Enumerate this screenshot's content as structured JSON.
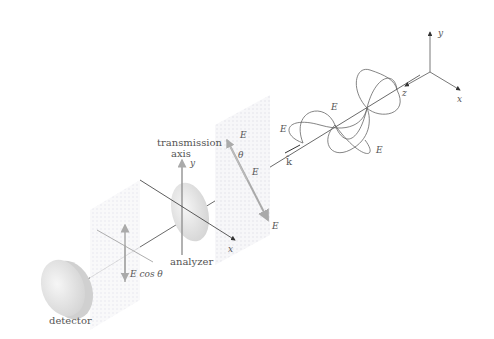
{
  "diagram": {
    "axes": {
      "x": "x",
      "y": "y",
      "z": "z"
    },
    "wave": {
      "labels": {
        "Ex": "E",
        "Ex_sub": "x",
        "Ey": "E",
        "Ey_sub": "y",
        "E": "E",
        "k": "k̂"
      }
    },
    "incident_plane": {
      "Ex": "E",
      "Ex_sub": "x",
      "Ey": "E",
      "Ey_sub": "y",
      "theta": "θ",
      "E": "E"
    },
    "analyzer": {
      "label": "analyzer",
      "axis_label_1": "transmission",
      "axis_label_2": "axis",
      "x": "x",
      "y": "y"
    },
    "transmitted": {
      "label": "E cos θ"
    },
    "detector": {
      "label": "detector"
    }
  }
}
